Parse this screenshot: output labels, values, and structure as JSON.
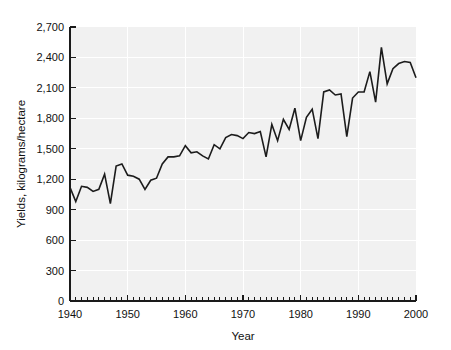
{
  "chart_data": {
    "type": "line",
    "title": "",
    "xlabel": "Year",
    "ylabel": "Yields, kilograms/hectare",
    "xlim": [
      1940,
      2000
    ],
    "ylim": [
      0,
      2700
    ],
    "grid": true,
    "legend": false,
    "legend_position": "none",
    "y_ticks": [
      0,
      300,
      600,
      900,
      1200,
      1500,
      1800,
      2100,
      2400,
      2700
    ],
    "y_tick_labels": [
      "0",
      "300",
      "600",
      "900",
      "1,200",
      "1,500",
      "1,800",
      "2,100",
      "2,400",
      "2,700"
    ],
    "x_ticks": [
      1940,
      1950,
      1960,
      1970,
      1980,
      1990,
      2000
    ],
    "x_tick_labels": [
      "1940",
      "1950",
      "1960",
      "1970",
      "1980",
      "1990",
      "2000"
    ],
    "x_minor_tick_step": 1,
    "line_color": "#1c1c1c",
    "plot_background": "#f1f1f1",
    "gridline_color": "#ffffff",
    "series": [
      {
        "name": "Yields",
        "x": [
          1940,
          1941,
          1942,
          1943,
          1944,
          1945,
          1946,
          1947,
          1948,
          1949,
          1950,
          1951,
          1952,
          1953,
          1954,
          1955,
          1956,
          1957,
          1958,
          1959,
          1960,
          1961,
          1962,
          1963,
          1964,
          1965,
          1966,
          1967,
          1968,
          1969,
          1970,
          1971,
          1972,
          1973,
          1974,
          1975,
          1976,
          1977,
          1978,
          1979,
          1980,
          1981,
          1982,
          1983,
          1984,
          1985,
          1986,
          1987,
          1988,
          1989,
          1990,
          1991,
          1992,
          1993,
          1994,
          1995,
          1996,
          1997,
          1998,
          1999,
          2000
        ],
        "values": [
          1120,
          980,
          1130,
          1120,
          1080,
          1100,
          1250,
          960,
          1330,
          1350,
          1240,
          1230,
          1200,
          1100,
          1190,
          1210,
          1350,
          1420,
          1420,
          1430,
          1530,
          1460,
          1470,
          1430,
          1400,
          1540,
          1500,
          1610,
          1640,
          1630,
          1600,
          1660,
          1650,
          1670,
          1420,
          1740,
          1580,
          1790,
          1690,
          1900,
          1580,
          1810,
          1890,
          1600,
          2060,
          2080,
          2030,
          2040,
          1620,
          2000,
          2060,
          2060,
          2260,
          1960,
          2500,
          2140,
          2290,
          2340,
          2360,
          2350,
          2200
        ]
      }
    ]
  },
  "axis_titles": {
    "x": "Year",
    "y": "Yields, kilograms/hectare"
  }
}
